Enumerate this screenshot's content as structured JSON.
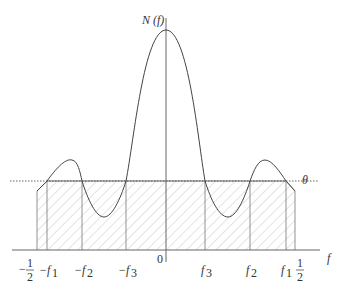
{
  "diagram": {
    "y_axis_label": "N (f)",
    "x_axis_label": "f",
    "threshold_label": "θ",
    "origin_label": "0",
    "tick_labels": {
      "neg_half_sign": "−",
      "half_num": "1",
      "half_den": "2",
      "neg_f1": "−f",
      "neg_f1_sub": "1",
      "neg_f2": "−f",
      "neg_f2_sub": "2",
      "neg_f3": "−f",
      "neg_f3_sub": "3",
      "f3": "f",
      "f3_sub": "3",
      "f2": "f",
      "f2_sub": "2",
      "f1": "f",
      "f1_sub": "1"
    },
    "colors": {
      "curve": "#444444",
      "axis": "#666666",
      "hatch": "#c8c8c8",
      "threshold": "#555555"
    }
  }
}
